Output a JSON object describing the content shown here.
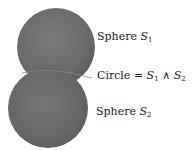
{
  "figure": {
    "spheres": [
      {
        "id": "S1",
        "cx": 56,
        "cy": 47,
        "r": 39,
        "color": "#6b6b6b"
      },
      {
        "id": "S2",
        "cx": 48,
        "cy": 108,
        "r": 40,
        "color": "#6b6b6b"
      }
    ]
  },
  "labels": {
    "sphere1": {
      "word": "Sphere",
      "symbol": "S",
      "sub": "1"
    },
    "circle": {
      "word": "Circle =",
      "s1": "S",
      "s1_sub": "1",
      "op": "∧",
      "s2": "S",
      "s2_sub": "2"
    },
    "sphere2": {
      "word": "Sphere",
      "symbol": "S",
      "sub": "2"
    }
  }
}
